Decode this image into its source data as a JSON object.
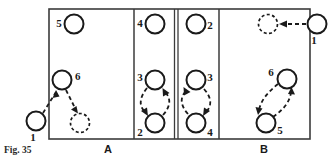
{
  "figure": {
    "caption": "Fig. 35",
    "caption_x": 4,
    "caption_y": 150,
    "frame": {
      "x": 49,
      "y": 9,
      "width": 261,
      "height": 130
    },
    "panel_labels": [
      {
        "id": "panel-label-a",
        "text": "A",
        "x": 108,
        "y": 149
      },
      {
        "id": "panel-label-b",
        "text": "B",
        "x": 264,
        "y": 149
      }
    ],
    "dividers": [
      {
        "id": "divider-a-2",
        "x": 134,
        "kind": "single"
      },
      {
        "id": "divider-2-3",
        "x": 174,
        "kind": "double-left"
      },
      {
        "id": "divider-2-3b",
        "x": 178,
        "kind": "double-right"
      },
      {
        "id": "divider-3-b",
        "x": 219,
        "kind": "single"
      }
    ],
    "panels": [
      {
        "id": "panel-a",
        "label": "A",
        "nodes": [
          {
            "id": "a-node-5",
            "label": "5",
            "cx": 74,
            "cy": 24,
            "r": 9.5,
            "style": "solid",
            "label_x": 59,
            "label_y": 24
          },
          {
            "id": "a-node-6",
            "label": "6",
            "cx": 62,
            "cy": 80,
            "r": 9.5,
            "style": "solid",
            "label_x": 75,
            "label_y": 77
          },
          {
            "id": "a-node-target",
            "label": "",
            "cx": 80,
            "cy": 123,
            "r": 9.5,
            "style": "dashed",
            "label_x": null,
            "label_y": null
          },
          {
            "id": "a-node-1-outside",
            "label": "1",
            "cx": 36,
            "cy": 121,
            "r": 9.5,
            "style": "solid",
            "label_x": 33,
            "label_y": 138
          }
        ],
        "arrows": [
          {
            "id": "arrow-a-1-to-6",
            "from": "a-node-1-outside",
            "to": "a-node-6",
            "direction": "up-right"
          },
          {
            "id": "arrow-a-6-to-target",
            "from": "a-node-6",
            "to": "a-node-target",
            "direction": "down-right"
          }
        ]
      },
      {
        "id": "panel-2",
        "label": "2",
        "nodes": [
          {
            "id": "p2-node-4",
            "label": "4",
            "cx": 155,
            "cy": 24,
            "r": 9.5,
            "style": "solid",
            "label_x": 140,
            "label_y": 24
          },
          {
            "id": "p2-node-3",
            "label": "3",
            "cx": 155,
            "cy": 80,
            "r": 9.5,
            "style": "solid",
            "label_x": 140,
            "label_y": 78
          },
          {
            "id": "p2-node-2",
            "label": "2",
            "cx": 155,
            "cy": 123,
            "r": 9.5,
            "style": "solid",
            "label_x": 140,
            "label_y": 133
          }
        ],
        "arrows": [
          {
            "id": "arrow-p2-3-to-2",
            "from": "p2-node-3",
            "to": "p2-node-2",
            "direction": "down-left-arc"
          },
          {
            "id": "arrow-p2-2-to-3",
            "from": "p2-node-2",
            "to": "p2-node-3",
            "direction": "up-right-arc"
          }
        ]
      },
      {
        "id": "panel-3",
        "label": "3",
        "nodes": [
          {
            "id": "p3-node-2",
            "label": "2",
            "cx": 196,
            "cy": 24,
            "r": 9.5,
            "style": "solid",
            "label_x": 210,
            "label_y": 26
          },
          {
            "id": "p3-node-3",
            "label": "3",
            "cx": 196,
            "cy": 80,
            "r": 9.5,
            "style": "solid",
            "label_x": 210,
            "label_y": 78
          },
          {
            "id": "p3-node-4",
            "label": "4",
            "cx": 196,
            "cy": 123,
            "r": 9.5,
            "style": "solid",
            "label_x": 210,
            "label_y": 133
          }
        ],
        "arrows": [
          {
            "id": "arrow-p3-4-to-3",
            "from": "p3-node-4",
            "to": "p3-node-3",
            "direction": "up-left-arc"
          },
          {
            "id": "arrow-p3-3-to-4",
            "from": "p3-node-3",
            "to": "p3-node-4",
            "direction": "down-right-arc"
          }
        ]
      },
      {
        "id": "panel-b",
        "label": "B",
        "nodes": [
          {
            "id": "b-node-target",
            "label": "",
            "cx": 268,
            "cy": 24,
            "r": 9.5,
            "style": "dashed",
            "label_x": null,
            "label_y": null
          },
          {
            "id": "b-node-1-outside",
            "label": "1",
            "cx": 317,
            "cy": 24,
            "r": 9.5,
            "style": "solid",
            "label_x": 314,
            "label_y": 41
          },
          {
            "id": "b-node-6",
            "label": "6",
            "cx": 287,
            "cy": 79,
            "r": 9.5,
            "style": "solid",
            "label_x": 271,
            "label_y": 73
          },
          {
            "id": "b-node-5",
            "label": "5",
            "cx": 266,
            "cy": 123,
            "r": 9.5,
            "style": "solid",
            "label_x": 280,
            "label_y": 131
          }
        ],
        "arrows": [
          {
            "id": "arrow-b-1-to-target",
            "from": "b-node-1-outside",
            "to": "b-node-target",
            "direction": "left"
          },
          {
            "id": "arrow-b-6-to-5",
            "from": "b-node-6",
            "to": "b-node-5",
            "direction": "down-left-arc"
          },
          {
            "id": "arrow-b-5-to-6",
            "from": "b-node-5",
            "to": "b-node-6",
            "direction": "up-right-arc"
          }
        ]
      }
    ]
  }
}
